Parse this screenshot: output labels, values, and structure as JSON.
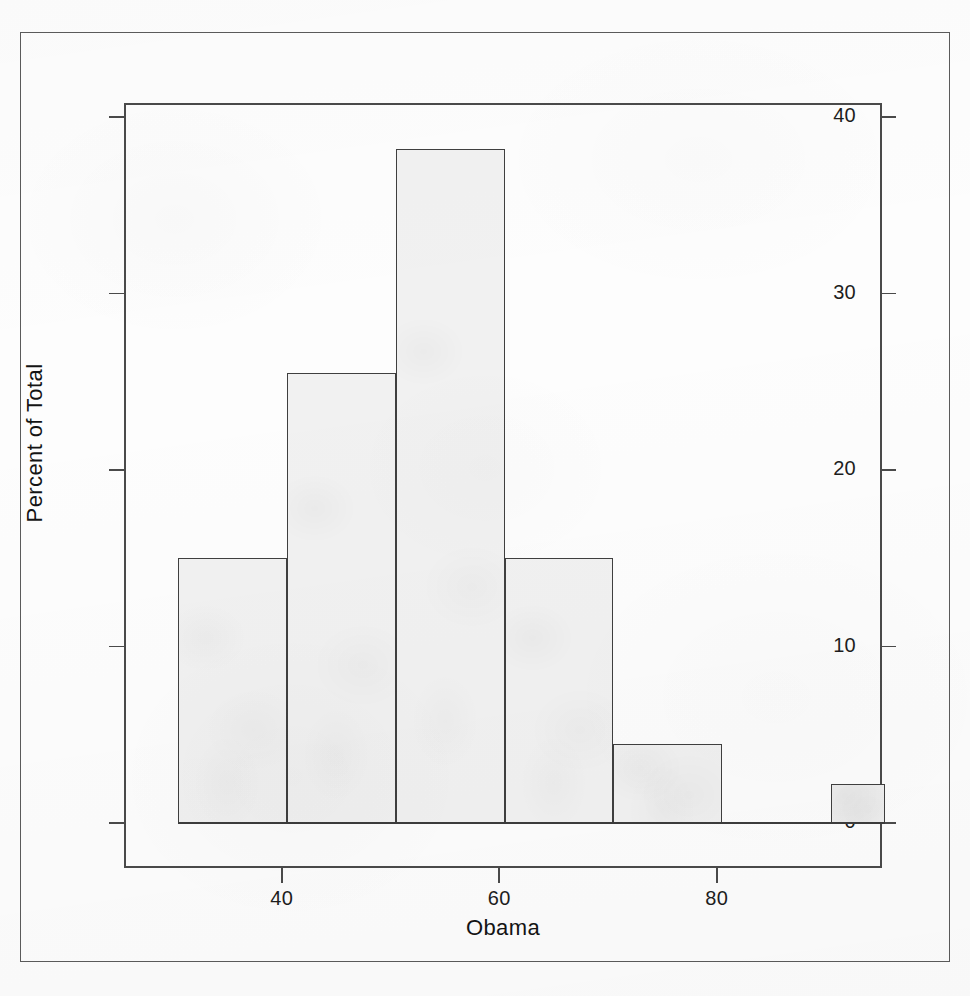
{
  "chart_data": {
    "type": "bar",
    "title": "",
    "subtitle": "",
    "xlabel": "Obama",
    "ylabel": "Percent of Total",
    "xlim": [
      25.5,
      95.2
    ],
    "ylim": [
      -2.0,
      41.6
    ],
    "grid": false,
    "legend": null,
    "bin_width": 10,
    "bin_edges": [
      30.5,
      40.5,
      50.5,
      60.5,
      70.5,
      80.5,
      90.5,
      95.5
    ],
    "categories": [
      "30.5-40.5",
      "40.5-50.5",
      "50.5-60.5",
      "60.5-70.5",
      "70.5-80.5",
      "80.5-90.5",
      "90.5-95.5"
    ],
    "values": [
      15.0,
      25.5,
      38.2,
      15.0,
      4.5,
      0.0,
      2.2
    ],
    "xticks": [
      40,
      60,
      80
    ],
    "xtick_labels": [
      "40",
      "60",
      "80"
    ],
    "yticks": [
      0,
      10,
      20,
      30,
      40
    ],
    "ytick_labels": [
      "0",
      "10",
      "20",
      "30",
      "40"
    ],
    "bar_fill_color": "#f1f1f1",
    "bar_border_color": "#3f3f3f",
    "axis_color": "#4a4a4a",
    "background_color": "#fdfdfd"
  },
  "figure": {
    "outer_border_color": "#5b5b5b"
  }
}
